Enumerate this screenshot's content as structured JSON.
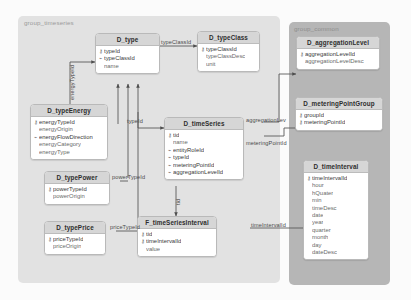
{
  "diagram": {
    "title": "group_timeseries",
    "groups": [
      {
        "id": "group-timeseries",
        "label": "group_timeseries",
        "color": "#e2e2e2"
      },
      {
        "id": "group-common",
        "label": "group_common",
        "color": "#b6b6b6"
      }
    ],
    "colors": {
      "canvas": "#fbfbfb",
      "group_timeseries": "#e2e2e2",
      "group_common": "#b6b6b6",
      "table_header": "#d6d6d6",
      "table_body": "#ffffff",
      "border": "#b9b9b9",
      "text": "#3a3a3a",
      "edge": "#555555"
    },
    "tables": [
      {
        "name": "D_type",
        "fields": [
          {
            "marker": "key",
            "name": "typeId"
          },
          {
            "marker": "index",
            "name": "typeClassId"
          },
          {
            "marker": "none",
            "name": "name"
          }
        ]
      },
      {
        "name": "D_typeClass",
        "fields": [
          {
            "marker": "key",
            "name": "typeClassId"
          },
          {
            "marker": "none",
            "name": "typeClassDesc"
          },
          {
            "marker": "none",
            "name": "unit"
          }
        ]
      },
      {
        "name": "D_typeEnergy",
        "fields": [
          {
            "marker": "key",
            "name": "energyTypeId"
          },
          {
            "marker": "none",
            "name": "energyOrigin"
          },
          {
            "marker": "index",
            "name": "energyFlowDirection"
          },
          {
            "marker": "none",
            "name": "energyCategory"
          },
          {
            "marker": "none",
            "name": "energyType"
          }
        ]
      },
      {
        "name": "D_typePower",
        "fields": [
          {
            "marker": "key",
            "name": "powerTypeId"
          },
          {
            "marker": "none",
            "name": "powerOrigin"
          }
        ]
      },
      {
        "name": "D_typePrice",
        "fields": [
          {
            "marker": "key",
            "name": "priceTypeId"
          },
          {
            "marker": "none",
            "name": "priceOrigin"
          }
        ]
      },
      {
        "name": "D_timeSeries",
        "fields": [
          {
            "marker": "key",
            "name": "tid"
          },
          {
            "marker": "none",
            "name": "name"
          },
          {
            "marker": "index",
            "name": "entityRoleId"
          },
          {
            "marker": "index",
            "name": "typeId"
          },
          {
            "marker": "index",
            "name": "meteringPointId"
          },
          {
            "marker": "index",
            "name": "aggregationLevelId"
          }
        ]
      },
      {
        "name": "F_timeSeriesInterval",
        "fields": [
          {
            "marker": "key",
            "name": "tid"
          },
          {
            "marker": "key",
            "name": "timeIntervalId"
          },
          {
            "marker": "none",
            "name": "value"
          }
        ]
      },
      {
        "name": "D_aggregationLevel",
        "fields": [
          {
            "marker": "key",
            "name": "aggregationLevelId"
          },
          {
            "marker": "none",
            "name": "aggregationLevelDesc"
          }
        ]
      },
      {
        "name": "D_meteringPointGroup",
        "fields": [
          {
            "marker": "key",
            "name": "groupId"
          },
          {
            "marker": "key",
            "name": "meteringPointId"
          }
        ]
      },
      {
        "name": "D_timeInterval",
        "fields": [
          {
            "marker": "key",
            "name": "timeIntervalId"
          },
          {
            "marker": "none",
            "name": "hour"
          },
          {
            "marker": "none",
            "name": "hQuater"
          },
          {
            "marker": "none",
            "name": "min"
          },
          {
            "marker": "none",
            "name": "timeDesc"
          },
          {
            "marker": "none",
            "name": "date"
          },
          {
            "marker": "none",
            "name": "year"
          },
          {
            "marker": "none",
            "name": "quarter"
          },
          {
            "marker": "none",
            "name": "month"
          },
          {
            "marker": "none",
            "name": "day"
          },
          {
            "marker": "none",
            "name": "dateDesc"
          }
        ]
      }
    ],
    "edge_labels": [
      {
        "id": "typeClassId",
        "text": "typeClassId"
      },
      {
        "id": "energyTypeId",
        "text": "energyTypeId"
      },
      {
        "id": "powerTypeId",
        "text": "powerTypeId"
      },
      {
        "id": "priceTypeId",
        "text": "priceTypeId"
      },
      {
        "id": "typeId",
        "text": "typeId"
      },
      {
        "id": "aggregationLevelId",
        "text": "aggregationLev"
      },
      {
        "id": "meteringPointId",
        "text": "meteringPointId"
      },
      {
        "id": "tid",
        "text": "tid"
      },
      {
        "id": "timeIntervalId",
        "text": "timeIntervalId"
      }
    ]
  }
}
